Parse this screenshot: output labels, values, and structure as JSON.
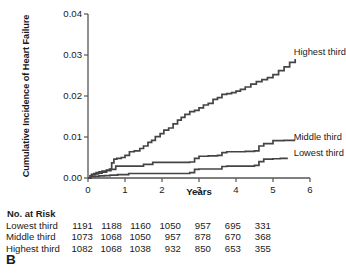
{
  "panel": {
    "label": "B"
  },
  "chart_data": {
    "type": "line",
    "subtype": "kaplan-meier-cumulative-incidence",
    "title": "",
    "xlabel": "Years",
    "ylabel": "Cumulative Incidence of Heart Failure",
    "xlim": [
      0,
      6
    ],
    "ylim": [
      0,
      0.04
    ],
    "xticks": [
      0,
      1,
      2,
      3,
      4,
      5,
      6
    ],
    "xtick_labels": [
      "0",
      "1",
      "2",
      "3",
      "4",
      "5",
      "6"
    ],
    "yticks": [
      0.0,
      0.01,
      0.02,
      0.03,
      0.04
    ],
    "ytick_labels": [
      "0.00",
      "0.01",
      "0.02",
      "0.03",
      "0.04"
    ],
    "grid": false,
    "legend_position": "inline-right-of-curves",
    "line_color": "#444444",
    "series": [
      {
        "name": "Highest third",
        "label": "Highest third",
        "label_x": 5.75,
        "label_y": 0.0305,
        "x": [
          0,
          0.06,
          0.1,
          0.16,
          0.22,
          0.3,
          0.38,
          0.5,
          0.58,
          0.64,
          0.7,
          0.78,
          0.9,
          1.0,
          1.12,
          1.25,
          1.4,
          1.5,
          1.62,
          1.72,
          1.82,
          1.95,
          2.05,
          2.18,
          2.3,
          2.42,
          2.52,
          2.62,
          2.75,
          2.88,
          3.0,
          3.12,
          3.25,
          3.38,
          3.5,
          3.62,
          3.75,
          3.88,
          4.0,
          4.12,
          4.25,
          4.4,
          4.55,
          4.7,
          4.85,
          5.0,
          5.15,
          5.3,
          5.45,
          5.6
        ],
        "y": [
          0.0,
          0.0006,
          0.0009,
          0.0011,
          0.0013,
          0.0015,
          0.0017,
          0.0019,
          0.0022,
          0.0037,
          0.0046,
          0.0048,
          0.005,
          0.0055,
          0.0064,
          0.0066,
          0.0072,
          0.0078,
          0.0087,
          0.0092,
          0.0101,
          0.0108,
          0.0117,
          0.0122,
          0.0132,
          0.0141,
          0.0148,
          0.0155,
          0.0162,
          0.0165,
          0.0171,
          0.0178,
          0.0182,
          0.0192,
          0.0196,
          0.0204,
          0.0206,
          0.0208,
          0.0212,
          0.0216,
          0.0222,
          0.0229,
          0.0235,
          0.024,
          0.0245,
          0.0252,
          0.0262,
          0.0271,
          0.0282,
          0.029
        ]
      },
      {
        "name": "Middle third",
        "label": "Middle third",
        "label_x": 5.75,
        "label_y": 0.0098,
        "x": [
          0,
          0.06,
          0.12,
          0.2,
          0.28,
          0.38,
          0.5,
          0.62,
          0.75,
          1.0,
          1.25,
          1.5,
          1.75,
          2.0,
          2.25,
          2.5,
          2.75,
          2.88,
          3.0,
          3.25,
          3.5,
          3.62,
          3.75,
          4.0,
          4.25,
          4.5,
          4.62,
          4.75,
          5.0,
          5.3,
          5.6
        ],
        "y": [
          0.0,
          0.0005,
          0.0008,
          0.001,
          0.0012,
          0.0014,
          0.0018,
          0.0021,
          0.0029,
          0.0029,
          0.0029,
          0.0033,
          0.0038,
          0.0038,
          0.0038,
          0.0038,
          0.0039,
          0.0048,
          0.0053,
          0.0054,
          0.0055,
          0.0062,
          0.0064,
          0.0064,
          0.0065,
          0.0066,
          0.0078,
          0.0084,
          0.0091,
          0.0092,
          0.0092
        ]
      },
      {
        "name": "Lowest third",
        "label": "Lowest third",
        "label_x": 5.75,
        "label_y": 0.0058,
        "x": [
          0,
          0.08,
          0.18,
          0.3,
          0.45,
          0.6,
          0.8,
          1.0,
          1.1,
          1.25,
          1.5,
          1.75,
          2.0,
          2.25,
          2.5,
          2.75,
          2.88,
          3.0,
          3.25,
          3.5,
          3.62,
          3.75,
          4.0,
          4.25,
          4.5,
          4.62,
          4.75,
          5.0,
          5.2,
          5.4
        ],
        "y": [
          0.0,
          0.0003,
          0.0004,
          0.0005,
          0.0006,
          0.0007,
          0.0008,
          0.0008,
          0.0011,
          0.0011,
          0.0011,
          0.0011,
          0.0011,
          0.0011,
          0.0011,
          0.0013,
          0.0021,
          0.0022,
          0.0022,
          0.0022,
          0.0028,
          0.0029,
          0.0029,
          0.0029,
          0.0031,
          0.004,
          0.0046,
          0.0047,
          0.0048,
          0.0048
        ]
      }
    ]
  },
  "risk_table": {
    "title": "No. at Risk",
    "rows": [
      {
        "label": "Lowest third",
        "values": [
          "1191",
          "1188",
          "1160",
          "1050",
          "957",
          "695",
          "331"
        ]
      },
      {
        "label": "Middle third",
        "values": [
          "1073",
          "1068",
          "1050",
          "957",
          "878",
          "670",
          "368"
        ]
      },
      {
        "label": "Highest third",
        "values": [
          "1082",
          "1068",
          "1038",
          "932",
          "850",
          "653",
          "355"
        ]
      }
    ]
  }
}
